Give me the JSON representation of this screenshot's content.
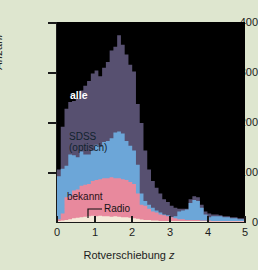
{
  "chart_data": {
    "type": "bar",
    "title": "",
    "subtitle": "",
    "xlabel": "Rotverschiebung z",
    "ylabel": "Anzahl",
    "xlim": [
      0,
      5
    ],
    "ylim": [
      0,
      420
    ],
    "grid": false,
    "legend_position": "inline-annotations",
    "bin_width": 0.1,
    "stacked": true,
    "x": [
      0.05,
      0.15,
      0.25,
      0.35,
      0.45,
      0.55,
      0.65,
      0.75,
      0.85,
      0.95,
      1.05,
      1.15,
      1.25,
      1.35,
      1.45,
      1.55,
      1.65,
      1.75,
      1.85,
      1.95,
      2.05,
      2.15,
      2.25,
      2.35,
      2.45,
      2.55,
      2.65,
      2.75,
      2.85,
      2.95,
      3.05,
      3.15,
      3.25,
      3.35,
      3.45,
      3.55,
      3.65,
      3.75,
      3.85,
      3.95,
      4.05,
      4.15,
      4.25,
      4.35,
      4.45,
      4.55,
      4.65,
      4.75,
      4.85,
      4.95
    ],
    "series": [
      {
        "name": "Radio",
        "color": "#f4ead9",
        "values": [
          2,
          3,
          4,
          6,
          8,
          9,
          10,
          11,
          12,
          13,
          12,
          13,
          12,
          12,
          11,
          12,
          11,
          10,
          10,
          9,
          8,
          7,
          5,
          4,
          4,
          3,
          3,
          2,
          2,
          2,
          2,
          2,
          2,
          2,
          2,
          2,
          2,
          2,
          2,
          2,
          1,
          1,
          1,
          1,
          1,
          1,
          1,
          1,
          1,
          1
        ]
      },
      {
        "name": "bekannt",
        "color": "#e8899d",
        "values": [
          6,
          18,
          52,
          54,
          66,
          68,
          76,
          78,
          80,
          86,
          88,
          90,
          92,
          92,
          94,
          92,
          92,
          90,
          88,
          84,
          80,
          60,
          36,
          34,
          28,
          22,
          20,
          16,
          14,
          12,
          10,
          8,
          6,
          6,
          4,
          4,
          4,
          4,
          3,
          3,
          3,
          2,
          2,
          2,
          2,
          2,
          2,
          2,
          2,
          2
        ]
      },
      {
        "name": "SDSS (optisch)",
        "color": "#6ca6d8",
        "values": [
          96,
          112,
          118,
          142,
          140,
          136,
          148,
          142,
          142,
          150,
          162,
          158,
          168,
          170,
          176,
          188,
          190,
          186,
          170,
          160,
          150,
          120,
          60,
          44,
          36,
          30,
          24,
          20,
          16,
          14,
          10,
          12,
          22,
          24,
          26,
          40,
          46,
          44,
          30,
          16,
          10,
          12,
          12,
          12,
          10,
          10,
          8,
          8,
          6,
          6
        ]
      },
      {
        "name": "alle",
        "color": "#575070",
        "values": [
          110,
          200,
          238,
          252,
          254,
          260,
          276,
          286,
          296,
          312,
          318,
          306,
          324,
          336,
          360,
          368,
          392,
          372,
          352,
          330,
          316,
          248,
          208,
          150,
          110,
          86,
          72,
          60,
          48,
          42,
          34,
          30,
          28,
          28,
          28,
          48,
          54,
          52,
          36,
          22,
          18,
          16,
          16,
          14,
          12,
          12,
          10,
          10,
          8,
          8
        ]
      }
    ],
    "ytick_labels": [
      "0",
      "100",
      "200",
      "300",
      "400"
    ],
    "ytick_values": [
      0,
      100,
      200,
      300,
      400
    ],
    "xtick_labels": [
      "0",
      "1",
      "2",
      "3",
      "4",
      "5"
    ],
    "xtick_values": [
      0,
      1,
      2,
      3,
      4,
      5
    ],
    "annotations": [
      {
        "text": "alle",
        "x": 0.35,
        "y": 270,
        "color": "#ffffff"
      },
      {
        "text": "SDSS",
        "x": 0.32,
        "y": 185,
        "color": "#11232e"
      },
      {
        "text": "(optisch)",
        "x": 0.32,
        "y": 168,
        "color": "#11232e"
      },
      {
        "text": "bekannt",
        "x": 0.27,
        "y": 62,
        "color": "#2a1118"
      },
      {
        "text": "Radio",
        "x": 1.25,
        "y": 38,
        "color": "#141414"
      }
    ],
    "colors": {
      "background": "#dee6cf",
      "plot_background": "#000000",
      "alle": "#575070",
      "sdss": "#6ca6d8",
      "bekannt": "#e8899d",
      "radio": "#f4ead9",
      "axis": "#1a1a1a"
    }
  },
  "axes": {
    "ylabel": "Anzahl",
    "xlabel_prefix": "Rotverschiebung ",
    "xlabel_symbol": "z",
    "yticks": [
      {
        "label": "400",
        "value": 400
      },
      {
        "label": "300",
        "value": 300
      },
      {
        "label": "200",
        "value": 200
      },
      {
        "label": "100",
        "value": 100
      },
      {
        "label": "0",
        "value": 0
      }
    ],
    "xticks": [
      {
        "label": "0",
        "value": 0
      },
      {
        "label": "1",
        "value": 1
      },
      {
        "label": "2",
        "value": 2
      },
      {
        "label": "3",
        "value": 3
      },
      {
        "label": "4",
        "value": 4
      },
      {
        "label": "5",
        "value": 5
      }
    ]
  },
  "labels": {
    "alle": "alle",
    "sdss_line1": "SDSS",
    "sdss_line2": "(optisch)",
    "bekannt": "bekannt",
    "radio": "Radio"
  }
}
